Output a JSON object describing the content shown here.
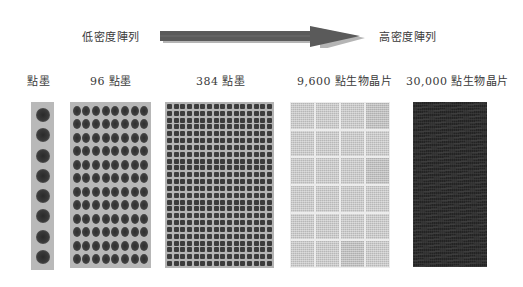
{
  "header": {
    "low_density_label": "低密度陣列",
    "high_density_label": "高密度陣列",
    "arrow_icon": "right-arrow-icon"
  },
  "panels": [
    {
      "label": "點墨",
      "type": "single-column dot strip",
      "rows": 8,
      "cols": 1
    },
    {
      "label": "96 點墨",
      "type": "96-well plate",
      "rows": 12,
      "cols": 8
    },
    {
      "label": "384 點墨",
      "type": "384-well plate",
      "rows": 24,
      "cols": 16
    },
    {
      "label": "9,600 點生物晶片",
      "type": "spotted biochip",
      "block_rows": 6,
      "block_cols": 4
    },
    {
      "label": "30,000 點生物晶片",
      "type": "high-density biochip"
    }
  ],
  "colors": {
    "arrow": "#5a5a5a",
    "arrow_shadow": "#b5b5b5",
    "dot": "#333333",
    "plate_bg": "#b7b7b7",
    "chip_dark": "#232323"
  }
}
